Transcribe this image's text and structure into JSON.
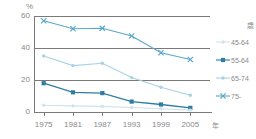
{
  "axes": {
    "y_unit": "%",
    "x_unit": "年",
    "y_ticks": [
      "0",
      "20",
      "40",
      "60"
    ],
    "x_ticks": [
      "1975",
      "1981",
      "1987",
      "1993",
      "1999",
      "2005"
    ]
  },
  "legend": {
    "title": "歳",
    "entries": [
      {
        "label": "45-64",
        "color": "#cfe3ec",
        "marker": "dot"
      },
      {
        "label": "55-64",
        "color": "#2f7da3",
        "marker": "square"
      },
      {
        "label": "65-74",
        "color": "#a8d2e4",
        "marker": "dot"
      },
      {
        "label": "75-",
        "color": "#5aa8c8",
        "marker": "cross"
      }
    ]
  },
  "chart_data": {
    "type": "line",
    "title": "",
    "xlabel": "年",
    "ylabel": "%",
    "ylim": [
      0,
      60
    ],
    "grid": true,
    "legend_position": "right",
    "legend_title": "歳",
    "categories": [
      "1975",
      "1981",
      "1987",
      "1993",
      "1999",
      "2005"
    ],
    "series": [
      {
        "name": "75-",
        "color": "#5aa8c8",
        "marker": "cross",
        "values": [
          57.0,
          52.0,
          52.3,
          47.5,
          37.0,
          32.8
        ]
      },
      {
        "name": "65-74",
        "color": "#a8d2e4",
        "marker": "dot",
        "values": [
          35.0,
          29.0,
          30.5,
          21.5,
          15.5,
          10.5
        ]
      },
      {
        "name": "55-64",
        "color": "#2f7da3",
        "marker": "square",
        "values": [
          18.0,
          12.3,
          11.8,
          6.5,
          4.7,
          2.6
        ]
      },
      {
        "name": "45-64",
        "color": "#cfe3ec",
        "marker": "dot",
        "values": [
          4.2,
          3.8,
          3.5,
          2.8,
          2.0,
          1.2
        ]
      }
    ]
  }
}
